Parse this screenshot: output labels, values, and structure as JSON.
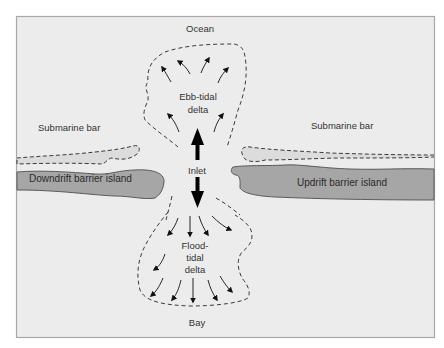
{
  "diagram": {
    "colors": {
      "page_background": "#ffffff",
      "frame_fill": "#ececec",
      "frame_border": "#a8a8a8",
      "island_fill": "#a6a6a6",
      "island_stroke": "#5a5a5a",
      "bar_fill": "#dcdcdc",
      "dash_stroke": "#3a3a3a",
      "arrow_color": "#111111",
      "label_color": "#333333"
    },
    "labels": {
      "ocean": "Ocean",
      "bay": "Bay",
      "ebb_delta_line1": "Ebb-tidal",
      "ebb_delta_line2": "delta",
      "flood_delta_line1": "Flood-",
      "flood_delta_line2": "tidal",
      "flood_delta_line3": "delta",
      "inlet": "Inlet",
      "submarine_bar_left": "Submarine bar",
      "submarine_bar_right": "Submarine bar",
      "downdrift_island": "Downdrift barrier island",
      "updrift_island": "Updrift barrier island"
    },
    "icons": {
      "flow_out": "arrow-up",
      "flow_in": "arrow-down"
    }
  }
}
